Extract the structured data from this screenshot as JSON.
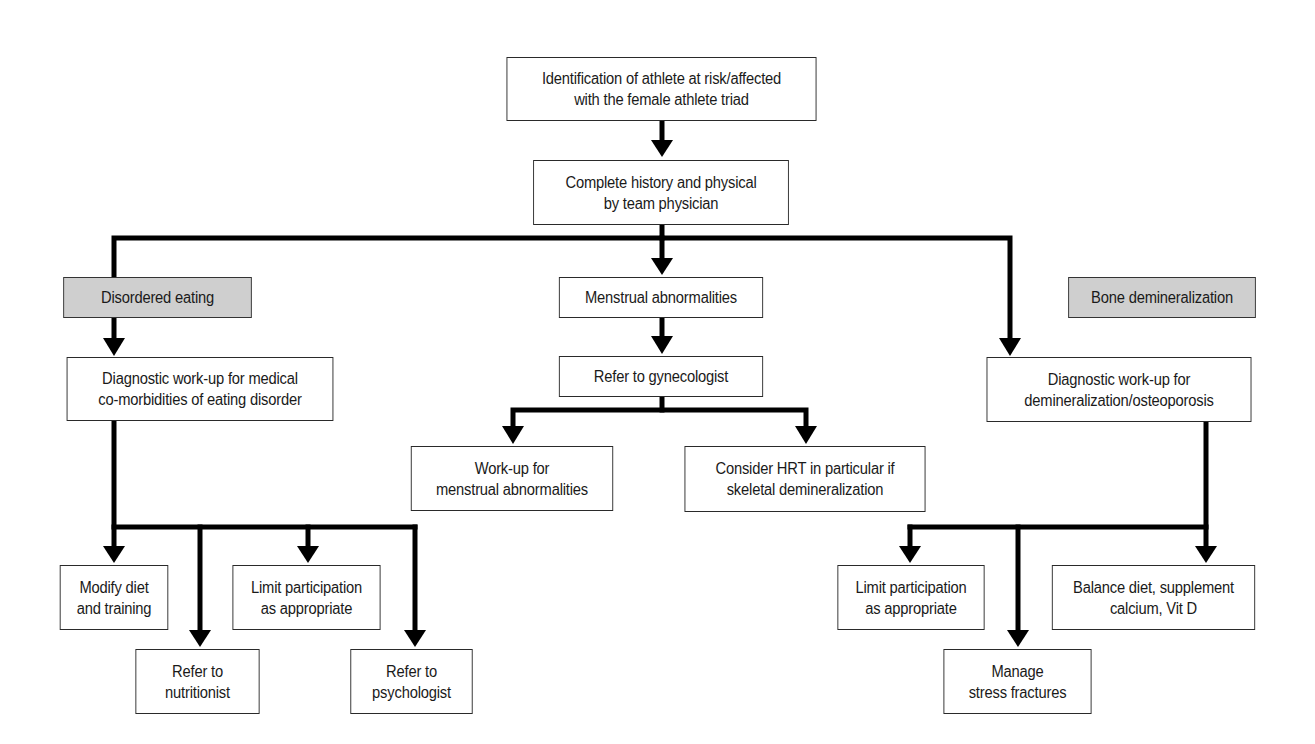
{
  "diagram": {
    "colors": {
      "line": "#000000",
      "box_border": "#2a2a2a",
      "category_fill": "#cfcfcf",
      "background": "#ffffff"
    },
    "nodes": {
      "identification": "Identification of athlete at risk/affected\nwith the female athlete triad",
      "history_physical": "Complete history and physical\nby team physician",
      "cat_disordered_eating": "Disordered eating",
      "cat_bone_demineralization": "Bone demineralization",
      "menstrual_abnormalities": "Menstrual abnormalities",
      "refer_gynecologist": "Refer to gynecologist",
      "diag_eating": "Diagnostic work-up for medical\nco-morbidities of eating disorder",
      "diag_bone": "Diagnostic work-up for\ndemineralization/osteoporosis",
      "workup_menstrual": "Work-up for\nmenstrual abnormalities",
      "consider_hrt": "Consider HRT in particular if\nskeletal demineralization",
      "modify_diet": "Modify diet\nand training",
      "limit_participation_left": "Limit participation\nas appropriate",
      "refer_nutritionist": "Refer to\nnutritionist",
      "refer_psychologist": "Refer to\npsychologist",
      "limit_participation_right": "Limit participation\nas appropriate",
      "balance_diet": "Balance diet, supplement\ncalcium, Vit D",
      "manage_fractures": "Manage\nstress fractures"
    },
    "edges": [
      [
        "identification",
        "history_physical"
      ],
      [
        "history_physical",
        "diag_eating"
      ],
      [
        "history_physical",
        "menstrual_abnormalities"
      ],
      [
        "history_physical",
        "diag_bone"
      ],
      [
        "menstrual_abnormalities",
        "refer_gynecologist"
      ],
      [
        "refer_gynecologist",
        "workup_menstrual"
      ],
      [
        "refer_gynecologist",
        "consider_hrt"
      ],
      [
        "diag_eating",
        "modify_diet"
      ],
      [
        "diag_eating",
        "refer_nutritionist"
      ],
      [
        "diag_eating",
        "limit_participation_left"
      ],
      [
        "diag_eating",
        "refer_psychologist"
      ],
      [
        "diag_bone",
        "limit_participation_right"
      ],
      [
        "diag_bone",
        "manage_fractures"
      ],
      [
        "diag_bone",
        "balance_diet"
      ]
    ]
  }
}
